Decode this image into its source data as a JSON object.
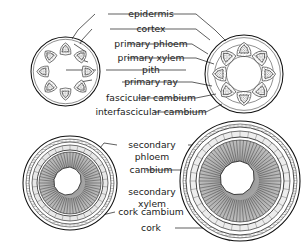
{
  "figure": {
    "background": "#ffffff",
    "ink": "#111111"
  },
  "labels": {
    "epidermis": "epidermis",
    "cortex": "cortex",
    "primary_phloem": "primary phloem",
    "primary_xylem": "primary xylem",
    "pith": "pith",
    "primary_ray": "primary ray",
    "fascicular_cambium": "fascicular cambium",
    "interfascicular_cambium": "interfascicular cambium",
    "secondary_phloem_l1": "secondary",
    "secondary_phloem_l2": "phloem",
    "cambium": "cambium",
    "secondary_xylem_l1": "secondary",
    "secondary_xylem_l2": "xylem",
    "cork_cambium": "cork cambium",
    "cork": "cork"
  },
  "panels": [
    {
      "id": "upper-left",
      "name": "young-stem-primary-growth",
      "cx": 65.5,
      "cy": 71.5,
      "r": 34.5,
      "bundle_count": 8,
      "bundle_ring_radius": 22.0,
      "stage": "primary"
    },
    {
      "id": "upper-right",
      "name": "stem-cambium-ring-forming",
      "cx": 244.0,
      "cy": 74.0,
      "r": 39.0,
      "bundle_count": 8,
      "bundle_ring_radius": 24.0,
      "stage": "cambium-ring"
    },
    {
      "id": "lower-left",
      "name": "stem-early-secondary-growth",
      "cx": 70.0,
      "cy": 183.0,
      "r": 47.0,
      "pith_radius": 16.0,
      "xylem_outer": 31.0,
      "cambium_radius": 33.0,
      "phloem_outer": 38.0,
      "cork_cambium_radius": 41.0,
      "stage": "secondary-early"
    },
    {
      "id": "lower-right",
      "name": "stem-advanced-secondary-growth",
      "cx": 240.0,
      "cy": 181.0,
      "r": 60.0,
      "pith_radius": 20.0,
      "xylem_outer": 41.0,
      "cambium_radius": 44.0,
      "phloem_outer": 50.0,
      "cork_cambium_radius": 54.0,
      "stage": "secondary-advanced"
    }
  ],
  "label_rows": [
    {
      "key": "epidermis",
      "x": 151,
      "y": 14
    },
    {
      "key": "cortex",
      "x": 151,
      "y": 29
    },
    {
      "key": "primary_phloem",
      "x": 151,
      "y": 44
    },
    {
      "key": "primary_xylem",
      "x": 151,
      "y": 58
    },
    {
      "key": "pith",
      "x": 151,
      "y": 70
    },
    {
      "key": "primary_ray",
      "x": 151,
      "y": 82
    },
    {
      "key": "fascicular_cambium",
      "x": 151,
      "y": 98
    },
    {
      "key": "interfascicular_cambium",
      "x": 151,
      "y": 112
    },
    {
      "key": "cambium",
      "x": 151,
      "y": 170
    },
    {
      "key": "cork_cambium",
      "x": 151,
      "y": 212
    },
    {
      "key": "cork",
      "x": 151,
      "y": 228
    }
  ]
}
